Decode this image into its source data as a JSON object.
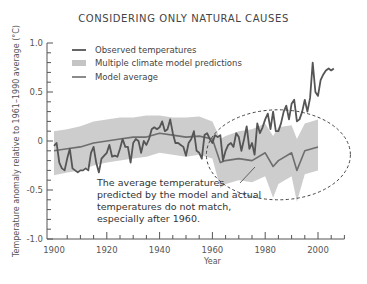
{
  "chart_data": {
    "type": "line",
    "title": "CONSIDERING ONLY NATURAL CAUSES",
    "xlabel": "Year",
    "ylabel": "Temperature anomaly relative to 1961–1990 average (°C)",
    "xlim": [
      1900,
      2010
    ],
    "ylim": [
      -1.0,
      1.0
    ],
    "xticks": [
      1900,
      1920,
      1940,
      1960,
      1980,
      2000
    ],
    "xtick_labels": [
      "1900",
      "1920",
      "1940",
      "1960",
      "1980",
      "2000"
    ],
    "yticks": [
      1.0,
      0.5,
      0,
      -0.5,
      -1.0
    ],
    "ytick_labels": [
      "1.0",
      "0.5",
      "0",
      "-0.5",
      "-1.0"
    ],
    "grid": false,
    "legend": {
      "position": "upper-left",
      "entries": [
        {
          "label": "Observed temperatures",
          "style": "line",
          "color": "#555555"
        },
        {
          "label": "Multiple climate model predictions",
          "style": "band",
          "color": "#c8c8c8"
        },
        {
          "label": "Model average",
          "style": "line",
          "color": "#777777"
        }
      ]
    },
    "series": [
      {
        "name": "Observed temperatures",
        "x": [
          1900,
          1901,
          1902,
          1903,
          1904,
          1905,
          1906,
          1907,
          1908,
          1909,
          1910,
          1911,
          1912,
          1913,
          1914,
          1915,
          1916,
          1917,
          1918,
          1919,
          1920,
          1921,
          1922,
          1923,
          1924,
          1925,
          1926,
          1927,
          1928,
          1929,
          1930,
          1931,
          1932,
          1933,
          1934,
          1935,
          1936,
          1937,
          1938,
          1939,
          1940,
          1941,
          1942,
          1943,
          1944,
          1945,
          1946,
          1947,
          1948,
          1949,
          1950,
          1951,
          1952,
          1953,
          1954,
          1955,
          1956,
          1957,
          1958,
          1959,
          1960,
          1961,
          1962,
          1963,
          1964,
          1965,
          1966,
          1967,
          1968,
          1969,
          1970,
          1971,
          1972,
          1973,
          1974,
          1975,
          1976,
          1977,
          1978,
          1979,
          1980,
          1981,
          1982,
          1983,
          1984,
          1985,
          1986,
          1987,
          1988,
          1989,
          1990,
          1991,
          1992,
          1993,
          1994,
          1995,
          1996,
          1997,
          1998,
          1999,
          2000,
          2001,
          2002,
          2003,
          2004,
          2005,
          2006
        ],
        "values": [
          -0.05,
          -0.02,
          -0.22,
          -0.28,
          -0.3,
          -0.18,
          -0.08,
          -0.28,
          -0.3,
          -0.32,
          -0.3,
          -0.3,
          -0.28,
          -0.3,
          -0.12,
          -0.06,
          -0.22,
          -0.32,
          -0.18,
          -0.15,
          -0.12,
          -0.04,
          -0.16,
          -0.15,
          -0.16,
          -0.08,
          0.02,
          -0.06,
          -0.06,
          -0.22,
          -0.02,
          0.02,
          0.0,
          -0.12,
          0.0,
          -0.04,
          0.02,
          0.12,
          0.14,
          0.12,
          0.14,
          0.2,
          0.1,
          0.12,
          0.22,
          0.08,
          -0.02,
          -0.02,
          -0.04,
          -0.06,
          -0.15,
          -0.02,
          0.02,
          0.1,
          -0.1,
          -0.12,
          -0.18,
          0.06,
          0.08,
          0.02,
          -0.02,
          0.06,
          0.04,
          0.06,
          -0.2,
          -0.1,
          -0.04,
          -0.02,
          -0.06,
          0.08,
          0.04,
          -0.1,
          0.02,
          0.15,
          -0.08,
          -0.02,
          -0.14,
          0.18,
          0.08,
          0.14,
          0.22,
          0.28,
          0.12,
          0.3,
          0.1,
          0.1,
          0.18,
          0.3,
          0.36,
          0.22,
          0.38,
          0.42,
          0.2,
          0.22,
          0.3,
          0.42,
          0.3,
          0.44,
          0.8,
          0.5,
          0.46,
          0.62,
          0.68,
          0.72,
          0.74,
          0.72,
          0.74
        ]
      },
      {
        "name": "Model average",
        "x": [
          1900,
          1905,
          1910,
          1915,
          1920,
          1925,
          1930,
          1935,
          1940,
          1945,
          1950,
          1955,
          1960,
          1963,
          1965,
          1970,
          1975,
          1980,
          1983,
          1985,
          1990,
          1992,
          1995,
          2000
        ],
        "values": [
          -0.1,
          -0.08,
          -0.06,
          -0.02,
          0.0,
          0.02,
          0.04,
          0.04,
          0.08,
          0.06,
          0.04,
          0.05,
          0.02,
          -0.22,
          -0.2,
          -0.18,
          -0.2,
          -0.12,
          -0.26,
          -0.2,
          -0.12,
          -0.3,
          -0.1,
          -0.06
        ]
      },
      {
        "name": "Multiple climate model predictions",
        "type": "band",
        "x": [
          1900,
          1905,
          1910,
          1915,
          1920,
          1925,
          1930,
          1935,
          1940,
          1945,
          1950,
          1955,
          1960,
          1963,
          1965,
          1970,
          1975,
          1980,
          1983,
          1985,
          1990,
          1992,
          1995,
          2000
        ],
        "upper": [
          0.1,
          0.12,
          0.15,
          0.2,
          0.22,
          0.24,
          0.24,
          0.26,
          0.26,
          0.24,
          0.24,
          0.25,
          0.2,
          0.02,
          0.05,
          0.1,
          0.12,
          0.18,
          0.05,
          0.14,
          0.16,
          0.02,
          0.18,
          0.22
        ],
        "lower": [
          -0.35,
          -0.32,
          -0.3,
          -0.25,
          -0.22,
          -0.2,
          -0.18,
          -0.16,
          -0.12,
          -0.14,
          -0.16,
          -0.14,
          -0.18,
          -0.48,
          -0.44,
          -0.4,
          -0.42,
          -0.36,
          -0.58,
          -0.44,
          -0.36,
          -0.62,
          -0.34,
          -0.3
        ]
      }
    ],
    "annotations": [
      {
        "text_lines": [
          "The average temperatures",
          "predicted by the model and actual",
          "temperatures do not match,",
          "especially after 1960."
        ],
        "shape": "dashed-ellipse",
        "ellipse_center": [
          1985,
          -0.1
        ],
        "pointer_to": [
          1968,
          -0.3
        ]
      }
    ]
  },
  "labels": {
    "title": "CONSIDERING ONLY NATURAL CAUSES",
    "xlabel": "Year",
    "ylabel": "Temperature anomaly relative to 1961–1990 average (°C)",
    "legend": [
      "Observed temperatures",
      "Multiple climate model predictions",
      "Model average"
    ],
    "annotation": [
      "The average temperatures",
      "predicted by the model and actual",
      "temperatures do not match,",
      "especially after 1960."
    ],
    "yticks": [
      "1.0",
      "0.5",
      "0",
      "-0.5",
      "-1.0"
    ],
    "xticks": [
      "1900",
      "1920",
      "1940",
      "1960",
      "1980",
      "2000"
    ]
  },
  "colors": {
    "observed": "#555555",
    "band": "#c4c4c4",
    "model_average": "#6e6e6e",
    "axis": "#555555"
  }
}
